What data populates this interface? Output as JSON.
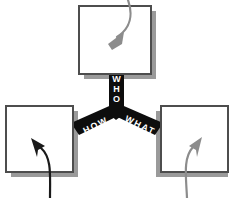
{
  "diagram": {
    "canvas": {
      "width": 233,
      "height": 198,
      "background": "#ffffff"
    },
    "colors": {
      "hub_fill": "#0d0d0d",
      "hub_text": "#ffffff",
      "box_fill": "#ffffff",
      "box_border": "#4d4d4d",
      "box_shadow": "#9a9a9a",
      "arrow_dark": "#1a1a1a",
      "arrow_light": "#8c8c8c"
    },
    "hub": {
      "name": "y-connector",
      "shape": "y-junction",
      "branches": [
        {
          "id": "who",
          "label": "WHO",
          "letters": [
            "W",
            "H",
            "O"
          ],
          "orientation": "vertical",
          "direction": "up",
          "connects_to": "box-top"
        },
        {
          "id": "how",
          "label": "HOW",
          "letters": [
            "H",
            "O",
            "W"
          ],
          "orientation": "diagonal",
          "direction": "down-left",
          "connects_to": "box-left"
        },
        {
          "id": "what",
          "label": "WHAT",
          "letters": [
            "W",
            "H",
            "A",
            "T"
          ],
          "orientation": "diagonal",
          "direction": "down-right",
          "connects_to": "box-right"
        }
      ]
    },
    "boxes": [
      {
        "id": "box-top",
        "name": "box-top",
        "position": "top",
        "text": "",
        "arrow": {
          "id": "arrow-top",
          "color_name": "light",
          "style": "curved",
          "entry": "from-top",
          "points_to": "down-left"
        }
      },
      {
        "id": "box-left",
        "name": "box-left",
        "position": "bottom-left",
        "text": "",
        "arrow": {
          "id": "arrow-left",
          "color_name": "dark",
          "style": "curved",
          "entry": "from-bottom",
          "points_to": "up-left"
        }
      },
      {
        "id": "box-right",
        "name": "box-right",
        "position": "bottom-right",
        "text": "",
        "arrow": {
          "id": "arrow-right",
          "color_name": "light",
          "style": "curved",
          "entry": "from-bottom",
          "points_to": "up-right"
        }
      }
    ]
  }
}
